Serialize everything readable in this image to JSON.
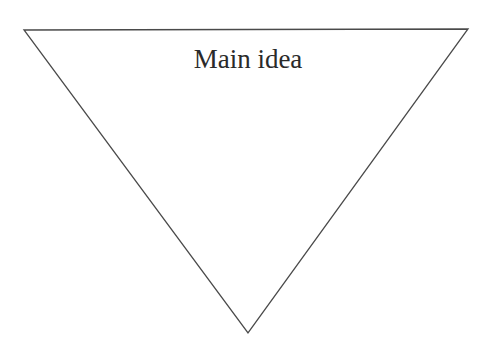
{
  "diagram": {
    "type": "inverted-triangle",
    "label": "Main idea",
    "stroke_color": "#4a4a4a",
    "fill_color": "#ffffff",
    "text_color": "#2a2a2a"
  }
}
